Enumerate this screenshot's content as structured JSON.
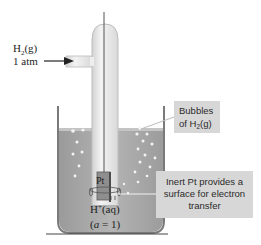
{
  "gas_label": {
    "line1_main": "H",
    "line1_sub": "2",
    "line1_tail": "(g)",
    "line2": "1 atm"
  },
  "electrode_label": "Pt",
  "solution_label": {
    "species_main": "H",
    "species_sup": "+",
    "species_tail": "(aq)",
    "activity_open": "(",
    "activity_var": "a",
    "activity_rest": " = 1)"
  },
  "callouts": {
    "bubbles": {
      "line1": "Bubbles",
      "line2_main": "of H",
      "line2_sub": "2",
      "line2_tail": "(g)"
    },
    "inert_pt": {
      "line1": "Inert Pt provides a",
      "line2": "surface for electron",
      "line3": "transfer"
    }
  },
  "colors": {
    "solution": "#a9a9a9",
    "beaker_wall": "#7d7d7d",
    "tube": "#e6e6e6",
    "callout_bg": "#d7d7d7",
    "bubble": "#f4f4f4"
  }
}
